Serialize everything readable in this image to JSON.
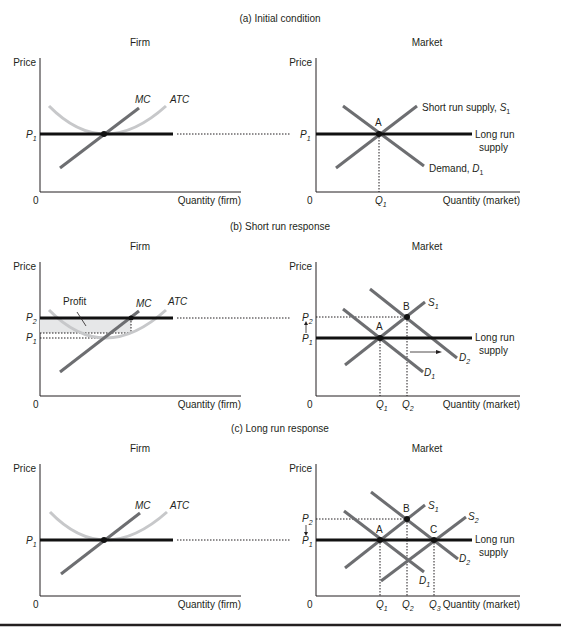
{
  "panels": [
    {
      "title": "(a) Initial condition",
      "firm": {
        "title": "Firm",
        "ylabel": "Price",
        "xlabel": "Quantity (firm)",
        "origin": "0",
        "price_labels": [
          "P",
          "1"
        ],
        "mc_label": "MC",
        "atc_label": "ATC"
      },
      "market": {
        "title": "Market",
        "ylabel": "Price",
        "xlabel": "Quantity (market)",
        "origin": "0",
        "p1": [
          "P",
          "1"
        ],
        "q1": [
          "Q",
          "1"
        ],
        "point_a": "A",
        "supply_label": "Short run supply, ",
        "supply_sym": [
          "S",
          "1"
        ],
        "demand_label": "Demand, ",
        "demand_sym": [
          "D",
          "1"
        ],
        "lr_label": [
          "Long run",
          "supply"
        ]
      }
    },
    {
      "title": "(b) Short run response",
      "firm": {
        "title": "Firm",
        "ylabel": "Price",
        "xlabel": "Quantity (firm)",
        "origin": "0",
        "p2": [
          "P",
          "2"
        ],
        "p1": [
          "P",
          "1"
        ],
        "profit_label": "Profit",
        "mc_label": "MC",
        "atc_label": "ATC"
      },
      "market": {
        "title": "Market",
        "ylabel": "Price",
        "xlabel": "Quantity (market)",
        "origin": "0",
        "p2": [
          "P",
          "2"
        ],
        "p1": [
          "P",
          "1"
        ],
        "q1": [
          "Q",
          "1"
        ],
        "q2": [
          "Q",
          "2"
        ],
        "point_a": "A",
        "point_b": "B",
        "s1": [
          "S",
          "1"
        ],
        "d1": [
          "D",
          "1"
        ],
        "d2": [
          "D",
          "2"
        ],
        "lr_label": [
          "Long run",
          "supply"
        ]
      }
    },
    {
      "title": "(c) Long run response",
      "firm": {
        "title": "Firm",
        "ylabel": "Price",
        "xlabel": "Quantity (firm)",
        "origin": "0",
        "p1": [
          "P",
          "1"
        ],
        "mc_label": "MC",
        "atc_label": "ATC"
      },
      "market": {
        "title": "Market",
        "ylabel": "Price",
        "xlabel": "Quantity (market)",
        "origin": "0",
        "p2": [
          "P",
          "2"
        ],
        "p1": [
          "P",
          "1"
        ],
        "q1": [
          "Q",
          "1"
        ],
        "q2": [
          "Q",
          "2"
        ],
        "q3": [
          "Q",
          "3"
        ],
        "point_a": "A",
        "point_b": "B",
        "point_c": "C",
        "s1": [
          "S",
          "1"
        ],
        "s2": [
          "S",
          "2"
        ],
        "d1": [
          "D",
          "1"
        ],
        "d2": [
          "D",
          "2"
        ],
        "lr_label": [
          "Long run",
          "supply"
        ]
      }
    }
  ]
}
